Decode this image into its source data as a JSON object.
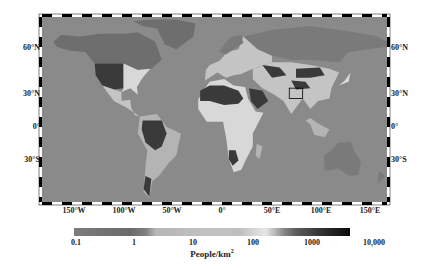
{
  "map": {
    "title": "",
    "projection": "equirectangular",
    "latitude_labels": [
      "60°N",
      "30°N",
      "0°",
      "30°S"
    ],
    "longitude_labels": [
      "150°W",
      "100°W",
      "50°W",
      "0°",
      "50°E",
      "100°E",
      "150°E"
    ],
    "highlight_box": {
      "description": "rectangle over northern India / Ganges region",
      "lon_range": [
        78,
        92
      ],
      "lat_range": [
        22,
        30
      ]
    },
    "colors": {
      "ocean": "#8a8a8a",
      "sparse": "#6e6e6e",
      "low": "#7a7a7a",
      "medium_light": "#b4b4b4",
      "medium": "#c4c4c4",
      "high": "#d8d8d8",
      "very_high": "#3a3a3a",
      "frame": "#000000"
    }
  },
  "colorbar": {
    "label": "People/km",
    "label_superscript": "2",
    "scale": "log",
    "ticks": [
      "0.1",
      "1",
      "10",
      "100",
      "1000",
      "10,000"
    ],
    "stops": [
      {
        "value": 0.1,
        "color": "#7d7d7d"
      },
      {
        "value": 0.3,
        "color": "#737373"
      },
      {
        "value": 1,
        "color": "#6a6a6a"
      },
      {
        "value": 2,
        "color": "#7f7f7f"
      },
      {
        "value": 3,
        "color": "#b6b6b6"
      },
      {
        "value": 10,
        "color": "#bcbcbc"
      },
      {
        "value": 30,
        "color": "#c2c2c2"
      },
      {
        "value": 100,
        "color": "#bfbfbf"
      },
      {
        "value": 200,
        "color": "#d9d9d9"
      },
      {
        "value": 300,
        "color": "#e6e6e6"
      },
      {
        "value": 450,
        "color": "#b5b5b5"
      },
      {
        "value": 600,
        "color": "#8c8c8c"
      },
      {
        "value": 1000,
        "color": "#5f5f5f"
      },
      {
        "value": 3000,
        "color": "#333333"
      },
      {
        "value": 10000,
        "color": "#0a0a0a"
      }
    ]
  }
}
